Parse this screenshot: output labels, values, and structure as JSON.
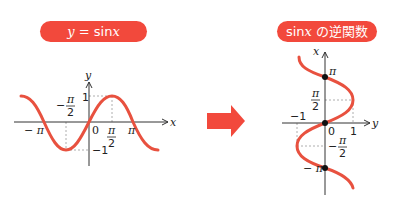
{
  "left_panel": {
    "title": "y = sinx",
    "title_parts": {
      "lhs": "y",
      "eq": " = ",
      "fn": "sin",
      "var": "x"
    },
    "axis_x": "x",
    "axis_y": "y",
    "ticks": {
      "neg_pi": "− π",
      "neg_half_pi_num": "π",
      "neg_half_pi_den": "2",
      "neg_sign": "−",
      "zero": "0",
      "half_pi_num": "π",
      "half_pi_den": "2",
      "pi": "π",
      "one": "1",
      "neg_one": "−1"
    }
  },
  "arrow": {
    "color": "#f2493c"
  },
  "right_panel": {
    "title": "sinx の逆関数",
    "title_parts": {
      "fn": "sin",
      "var": "x",
      "suffix": " の逆関数"
    },
    "axis_vertical": "x",
    "axis_horizontal": "y",
    "ticks": {
      "pi": "π",
      "half_pi_num": "π",
      "half_pi_den": "2",
      "neg_one": "−1",
      "zero": "0",
      "one": "1",
      "neg_sign": "−",
      "neg_half_pi_num": "π",
      "neg_half_pi_den": "2",
      "neg_pi": "− π"
    }
  },
  "colors": {
    "curve": "#e8513f",
    "pill": "#f2493c",
    "axis": "#333333",
    "guide": "#999999"
  }
}
